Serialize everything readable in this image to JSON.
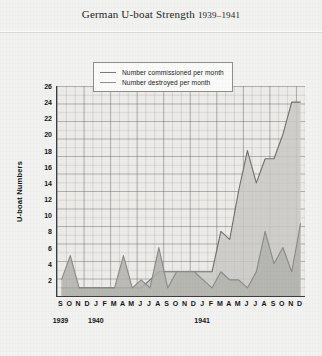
{
  "title": {
    "main": "German U-boat Strength",
    "years": "1939–1941"
  },
  "legend": {
    "position": "top-center",
    "items": [
      {
        "key": "commissioned",
        "label": "Number commissioned per month"
      },
      {
        "key": "destroyed",
        "label": "Number destroyed per month"
      }
    ]
  },
  "axes": {
    "ylabel": "U-boat Numbers",
    "yticks": [
      "2",
      "4",
      "6",
      "8",
      "10",
      "12",
      "14",
      "16",
      "18",
      "20",
      "22",
      "24",
      "26"
    ],
    "year_labels": [
      "1939",
      "1940",
      "1941"
    ]
  },
  "colors": {
    "page_background": "#f2f2f0",
    "plot_background": "#edece9",
    "axis": "#3d3d3d",
    "grid_minor": "#787d87",
    "grid_major": "#5a5f69",
    "commissioned_line": "#6f6f6c",
    "commissioned_fill": "#c9c9c4",
    "destroyed_line": "#8a8a86",
    "destroyed_fill": "#b3b3ae",
    "text": "#141414"
  },
  "chart_data": {
    "type": "area",
    "title": "German U-boat Strength 1939–1941",
    "xlabel": "",
    "ylabel": "U-boat Numbers",
    "ylim": [
      0,
      26
    ],
    "yticks": [
      2,
      4,
      6,
      8,
      10,
      12,
      14,
      16,
      18,
      20,
      22,
      24,
      26
    ],
    "grid": true,
    "legend_position": "top-center",
    "categories": [
      "S 1939",
      "O 1939",
      "N 1939",
      "D 1939",
      "J 1940",
      "F 1940",
      "M 1940",
      "A 1940",
      "M 1940",
      "J 1940",
      "J 1940",
      "A 1940",
      "S 1940",
      "O 1940",
      "N 1940",
      "D 1940",
      "J 1941",
      "F 1941",
      "M 1941",
      "A 1941",
      "M 1941",
      "J 1941",
      "J 1941",
      "A 1941",
      "S 1941",
      "O 1941",
      "N 1941",
      "D 1941"
    ],
    "tick_labels": [
      "S",
      "O",
      "N",
      "D",
      "J",
      "F",
      "M",
      "A",
      "M",
      "J",
      "J",
      "A",
      "S",
      "O",
      "N",
      "D",
      "J",
      "F",
      "M",
      "A",
      "M",
      "J",
      "J",
      "A",
      "S",
      "O",
      "N",
      "D"
    ],
    "year_groups": [
      {
        "year": "1939",
        "start_index": 0,
        "end_index": 3
      },
      {
        "year": "1940",
        "start_index": 4,
        "end_index": 15
      },
      {
        "year": "1941",
        "start_index": 16,
        "end_index": 27
      }
    ],
    "series": [
      {
        "name": "Number commissioned per month",
        "key": "commissioned",
        "values": [
          1,
          1,
          1,
          1,
          1,
          1,
          1,
          1,
          1,
          1,
          2,
          3,
          3,
          3,
          3,
          3,
          3,
          3,
          8,
          7,
          13,
          18,
          14,
          17,
          17,
          20,
          24,
          24
        ]
      },
      {
        "name": "Number destroyed per month",
        "key": "destroyed",
        "values": [
          2,
          5,
          1,
          1,
          1,
          1,
          1,
          5,
          1,
          2,
          1,
          6,
          1,
          3,
          3,
          3,
          2,
          1,
          3,
          2,
          2,
          1,
          3,
          8,
          4,
          6,
          3,
          9
        ]
      }
    ]
  }
}
